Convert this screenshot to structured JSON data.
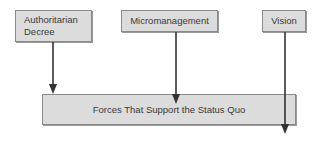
{
  "diagram": {
    "type": "force-field",
    "top_boxes": [
      {
        "label": "Authoritarian Decree",
        "lines": [
          "Authoritarian",
          "Decree"
        ]
      },
      {
        "label": "Micromanagement"
      },
      {
        "label": "Vision"
      }
    ],
    "bottom_box": {
      "label": "Forces That Support the Status Quo"
    },
    "arrows": [
      {
        "from": "Authoritarian Decree",
        "to": "Forces That Support the Status Quo",
        "ends": "at-box-top"
      },
      {
        "from": "Micromanagement",
        "to": "Forces That Support the Status Quo",
        "ends": "inside-box"
      },
      {
        "from": "Vision",
        "to": "Forces That Support the Status Quo",
        "ends": "through-box-below"
      }
    ],
    "colors": {
      "box_fill": "#dcdcdc",
      "box_border": "#8a8a8a",
      "arrow": "#333333",
      "text": "#3a3a3a"
    }
  }
}
